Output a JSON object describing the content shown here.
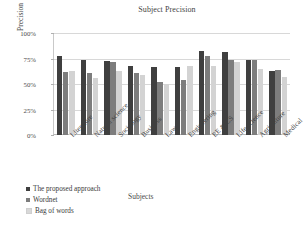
{
  "chart_data": {
    "type": "bar",
    "title": "Subject Precision",
    "xlabel": "Subjects",
    "ylabel": "Precision",
    "ylim": [
      0,
      100
    ],
    "yticks": [
      "0%",
      "25%",
      "50%",
      "75%",
      "100%"
    ],
    "ytick_values": [
      0,
      25,
      50,
      75,
      100
    ],
    "grid": true,
    "legend_position": "bottom-left",
    "categories": [
      "Literature",
      "Natural science",
      "Sociology",
      "Business",
      "Law",
      "Engineering",
      "EE & CS",
      "Life science",
      "Agriculture",
      "Medical"
    ],
    "series": [
      {
        "name": "The proposed approach",
        "color": "#3f3f3f",
        "values": [
          77,
          74,
          73,
          68,
          67,
          67,
          82,
          81,
          74,
          63
        ]
      },
      {
        "name": "Wordnet",
        "color": "#7d7d7d",
        "values": [
          62,
          61,
          72,
          61,
          52,
          54,
          77,
          74,
          74,
          64
        ]
      },
      {
        "name": "Bag of words",
        "color": "#d3d3d3",
        "values": [
          63,
          56,
          63,
          59,
          50,
          68,
          68,
          72,
          65,
          57
        ]
      }
    ]
  }
}
